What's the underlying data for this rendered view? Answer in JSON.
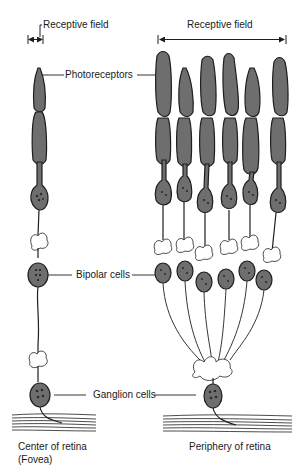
{
  "diagram": {
    "left_column": {
      "receptive_field_label": "Receptive field",
      "caption_line1": "Center of retina",
      "caption_line2": "(Fovea)",
      "photoreceptor_count": 1,
      "bipolar_count": 1,
      "ganglion_count": 1
    },
    "right_column": {
      "receptive_field_label": "Receptive field",
      "caption": "Periphery of retina",
      "photoreceptor_count": 6,
      "bipolar_count": 6,
      "ganglion_count": 1
    },
    "center_labels": {
      "photoreceptors": "Photoreceptors",
      "bipolar": "Bipolar cells",
      "ganglion": "Ganglion cells"
    },
    "colors": {
      "cell_fill": "#6e6e6e",
      "outline": "#1e1e1e",
      "background": "#ffffff"
    }
  }
}
